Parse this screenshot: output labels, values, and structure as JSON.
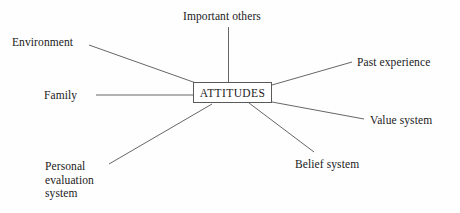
{
  "diagram": {
    "title": "ATTITUDES",
    "type": "spoke-diagram",
    "center": {
      "label": "ATTITUDES",
      "box": {
        "x": 193,
        "y": 82,
        "width": 79,
        "height": 21
      }
    },
    "line_color": "#555555",
    "background_color": "#fefefe",
    "text_color": "#1a1a1a",
    "nodes": [
      {
        "id": "important-others",
        "label": "Important others",
        "lines": [
          "Important others"
        ],
        "label_x": 183,
        "label_y": 10,
        "connector": {
          "x1": 228.5,
          "y1": 27,
          "x2": 228.5,
          "y2": 82
        }
      },
      {
        "id": "environment",
        "label": "Environment",
        "lines": [
          "Environment"
        ],
        "label_x": 12,
        "label_y": 36,
        "connector": {
          "x1": 89,
          "y1": 45,
          "x2": 196,
          "y2": 83
        }
      },
      {
        "id": "family",
        "label": "Family",
        "lines": [
          "Family"
        ],
        "label_x": 44,
        "label_y": 89,
        "connector": {
          "x1": 96,
          "y1": 95,
          "x2": 193,
          "y2": 95
        }
      },
      {
        "id": "personal-evaluation-system",
        "label": "Personal evaluation system",
        "lines": [
          "Personal",
          "evaluation",
          "system"
        ],
        "label_x": 45,
        "label_y": 160,
        "connector": {
          "x1": 109,
          "y1": 164,
          "x2": 212,
          "y2": 104
        }
      },
      {
        "id": "past-experience",
        "label": "Past experience",
        "lines": [
          "Past experience"
        ],
        "label_x": 357,
        "label_y": 56,
        "connector": {
          "x1": 272,
          "y1": 85,
          "x2": 352,
          "y2": 62
        }
      },
      {
        "id": "value-system",
        "label": "Value system",
        "lines": [
          "Value system"
        ],
        "label_x": 370,
        "label_y": 114,
        "connector": {
          "x1": 272,
          "y1": 102,
          "x2": 364,
          "y2": 119
        }
      },
      {
        "id": "belief-system",
        "label": "Belief system",
        "lines": [
          "Belief system"
        ],
        "label_x": 295,
        "label_y": 158,
        "connector": {
          "x1": 249,
          "y1": 103,
          "x2": 314,
          "y2": 152
        }
      }
    ]
  }
}
